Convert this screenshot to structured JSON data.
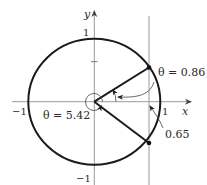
{
  "diagram": {
    "type": "unit-circle",
    "axes": {
      "x_label": "x",
      "y_label": "y",
      "ticks": {
        "x_pos": "1",
        "x_neg": "−1",
        "y_pos": "1",
        "y_neg": "−1"
      }
    },
    "annotations": {
      "upper_angle": "θ = 0.86",
      "lower_angle": "θ = 5.42",
      "vertical_line_x": "0.65"
    },
    "colors": {
      "circle": "#1a1a1a",
      "axes": "#9a9a9a",
      "text": "#2a2a2a"
    }
  }
}
